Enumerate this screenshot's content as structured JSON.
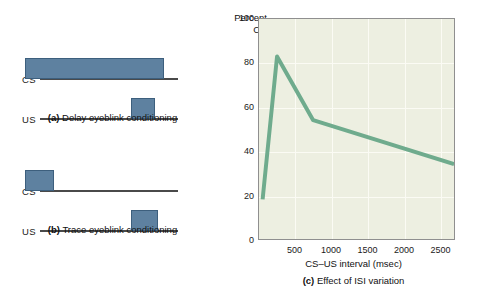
{
  "figure": {
    "panels": {
      "delay": {
        "caption_letter": "(a)",
        "caption_text": " Delay eyeblink conditioning",
        "cs_label": "CS",
        "us_label": "US",
        "cs_pulse": {
          "start_pct": 11,
          "width_pct": 62,
          "height_px": 21
        },
        "us_pulse": {
          "start_pct": 58,
          "width_pct": 11,
          "height_px": 21
        }
      },
      "trace": {
        "caption_letter": "(b)",
        "caption_text": " Trace eyeblink conditioning",
        "cs_label": "CS",
        "us_label": "US",
        "cs_pulse": {
          "start_pct": 11,
          "width_pct": 13,
          "height_px": 21
        },
        "us_pulse": {
          "start_pct": 58,
          "width_pct": 12,
          "height_px": 21
        }
      }
    },
    "colors": {
      "pulse_fill": "#5e81a0",
      "pulse_stroke": "#3d5f7d",
      "baseline": "#4a4a4a",
      "plot_background": "#edefe1",
      "plot_border": "#8f8f8f",
      "gridline": "#fbfbf4",
      "line_series": "#6fab8d"
    }
  },
  "chart_data": {
    "type": "line",
    "title": "",
    "caption_letter": "(c)",
    "caption_text": " Effect of ISI variation",
    "xlabel": "CS–US interval (msec)",
    "ylabel_line1": "Percent",
    "ylabel_line2": "CR",
    "xlim": [
      0,
      2700
    ],
    "ylim": [
      0,
      100
    ],
    "xticks": [
      500,
      1000,
      1500,
      2000,
      2500
    ],
    "xtick_labels": [
      "500",
      "1000",
      "1500",
      "2000",
      "2500"
    ],
    "yticks": [
      0,
      20,
      40,
      60,
      80,
      100
    ],
    "ytick_labels": [
      "0",
      "20",
      "40",
      "60",
      "80",
      "100"
    ],
    "grid": true,
    "legend": "none",
    "x": [
      50,
      250,
      750,
      2700
    ],
    "y": [
      18,
      83,
      54,
      34
    ],
    "series": [
      {
        "name": "Percent CR",
        "color": "#6fab8d",
        "points": [
          {
            "x": 50,
            "y": 18
          },
          {
            "x": 250,
            "y": 83
          },
          {
            "x": 750,
            "y": 54
          },
          {
            "x": 2700,
            "y": 34
          }
        ]
      }
    ]
  }
}
